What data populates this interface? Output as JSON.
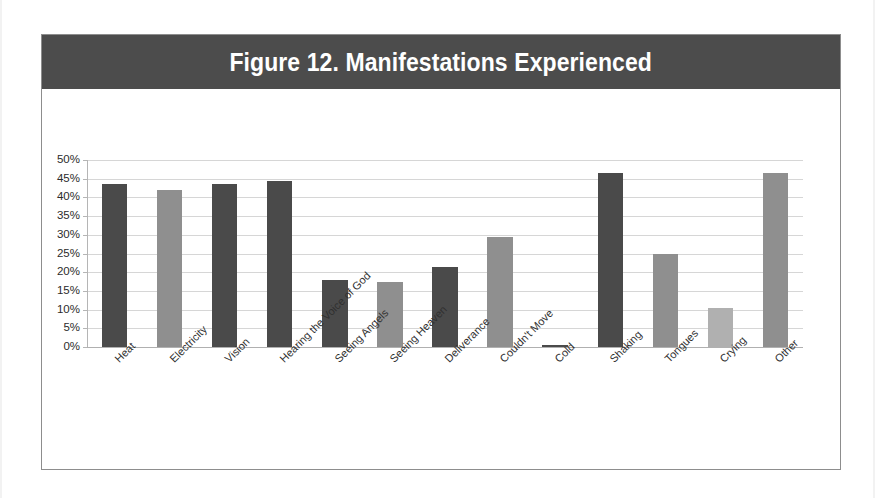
{
  "figure": {
    "title": "Figure 12. Manifestations Experienced",
    "banner_color": "#4c4c4c",
    "title_color": "#ffffff",
    "frame_color": "#8d8d8d"
  },
  "axis": {
    "y_tick_labels": [
      "50%",
      "45%",
      "40%",
      "35%",
      "30%",
      "25%",
      "20%",
      "15%",
      "10%",
      "5%",
      "0%"
    ]
  },
  "chart_data": {
    "type": "bar",
    "title": "Figure 12. Manifestations Experienced",
    "xlabel": "",
    "ylabel": "",
    "ylim": [
      0,
      50
    ],
    "ytick_values": [
      0,
      5,
      10,
      15,
      20,
      25,
      30,
      35,
      40,
      45,
      50
    ],
    "ytick_labels": [
      "0%",
      "5%",
      "10%",
      "15%",
      "20%",
      "25%",
      "30%",
      "35%",
      "40%",
      "45%",
      "50%"
    ],
    "grid": true,
    "legend": "none",
    "value_suffix": "%",
    "categories": [
      "Heat",
      "Electricity",
      "Vision",
      "Hearing the Voice of God",
      "Seeing Angels",
      "Seeing Heaven",
      "Deliverance",
      "Couldn't Move",
      "Cold",
      "Shaking",
      "Tongues",
      "Crying",
      "Other"
    ],
    "values": [
      43.5,
      42,
      43.5,
      44.5,
      18,
      17.5,
      21.5,
      29.5,
      0.5,
      46.5,
      25,
      10.5,
      46.5
    ],
    "bar_colors": [
      "#4a4a4a",
      "#8f8f8f",
      "#4a4a4a",
      "#4a4a4a",
      "#4a4a4a",
      "#8f8f8f",
      "#4a4a4a",
      "#8f8f8f",
      "#4a4a4a",
      "#4a4a4a",
      "#8f8f8f",
      "#b0b0b0",
      "#8f8f8f"
    ]
  }
}
